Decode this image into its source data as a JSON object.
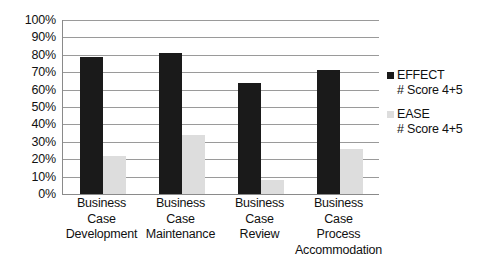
{
  "chart_data": {
    "type": "bar",
    "title": "",
    "subtitle": "",
    "xlabel": "",
    "ylabel": "",
    "ylim": [
      0,
      100
    ],
    "grid": true,
    "legend_position": "right",
    "y_ticks": [
      "100%",
      "90%",
      "80%",
      "70%",
      "60%",
      "50%",
      "40%",
      "30%",
      "20%",
      "10%",
      "0%"
    ],
    "y_tick_values": [
      100,
      90,
      80,
      70,
      60,
      50,
      40,
      30,
      20,
      10,
      0
    ],
    "categories": [
      "Business Case Development",
      "Business Case Maintenance",
      "Business Case Review",
      "Business Case Process Accommodation"
    ],
    "category_lines": [
      [
        "Business",
        "Case",
        "Development"
      ],
      [
        "Business",
        "Case",
        "Maintenance"
      ],
      [
        "Business",
        "Case",
        "Review"
      ],
      [
        "Business",
        "Case",
        "Process",
        "Accommodation"
      ]
    ],
    "series": [
      {
        "name": "EFFECT",
        "sub": "# Score 4+5",
        "color": "#1a1a1a",
        "values": [
          79,
          81,
          64,
          71
        ]
      },
      {
        "name": "EASE",
        "sub": "# Score 4+5",
        "color": "#dddddd",
        "values": [
          22,
          34,
          8,
          26
        ]
      }
    ]
  },
  "legend": {
    "entries": [
      {
        "name": "EFFECT",
        "sub": "# Score 4+5"
      },
      {
        "name": "EASE",
        "sub": "# Score 4+5"
      }
    ]
  },
  "colors": {
    "effect": "#1a1a1a",
    "ease": "#dddddd",
    "gridline": "#9a9a9a",
    "axis": "#8a8a8a",
    "background": "#ffffff",
    "text": "#111111"
  }
}
